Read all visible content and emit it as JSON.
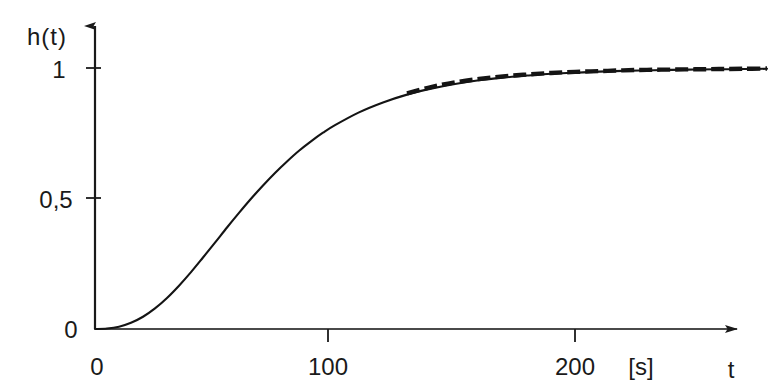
{
  "chart_data": {
    "type": "line",
    "title": "",
    "subtitle": "",
    "xlabel": "t",
    "xunit": "[s]",
    "ylabel": "h(t)",
    "xlim": [
      0,
      280
    ],
    "ylim": [
      0,
      1.08
    ],
    "grid": false,
    "legend": "none",
    "x_ticks": [
      {
        "value": 0,
        "label": "0"
      },
      {
        "value": 100,
        "label": "100"
      },
      {
        "value": 200,
        "label": "200"
      }
    ],
    "y_ticks": [
      {
        "value": 0,
        "label": "0"
      },
      {
        "value": 0.5,
        "label": "0,5"
      },
      {
        "value": 1,
        "label": "1"
      }
    ],
    "x": [
      0,
      5,
      10,
      15,
      20,
      25,
      30,
      35,
      40,
      45,
      50,
      55,
      60,
      65,
      70,
      75,
      80,
      85,
      90,
      95,
      100,
      110,
      120,
      130,
      140,
      150,
      160,
      170,
      180,
      190,
      200,
      210,
      220,
      230,
      240,
      250,
      260,
      270,
      280
    ],
    "series": [
      {
        "name": "h(t)",
        "style": "solid",
        "color": "#141414",
        "values": [
          0.0,
          0.002,
          0.009,
          0.024,
          0.047,
          0.079,
          0.119,
          0.166,
          0.218,
          0.274,
          0.331,
          0.389,
          0.445,
          0.499,
          0.55,
          0.598,
          0.642,
          0.683,
          0.719,
          0.752,
          0.781,
          0.83,
          0.868,
          0.898,
          0.921,
          0.939,
          0.953,
          0.963,
          0.971,
          0.978,
          0.982,
          0.986,
          0.989,
          0.991,
          0.993,
          0.994,
          0.995,
          0.996,
          0.997
        ]
      },
      {
        "name": "approximation",
        "style": "dashed",
        "color": "#141414",
        "x_start": 125,
        "values": [
          null,
          null,
          null,
          null,
          null,
          null,
          null,
          null,
          null,
          null,
          null,
          null,
          null,
          null,
          null,
          null,
          null,
          null,
          null,
          null,
          null,
          null,
          null,
          0.903,
          0.927,
          0.945,
          0.958,
          0.968,
          0.975,
          0.981,
          0.985,
          0.988,
          0.991,
          0.993,
          0.994,
          0.995,
          0.996,
          0.997,
          0.998
        ]
      }
    ]
  },
  "axes": {
    "y_axis_label": "h(t)",
    "x_axis_label": "t",
    "x_axis_unit": "[s]",
    "y_tick_1": "1",
    "y_tick_half": "0,5",
    "y_tick_zero": "0",
    "x_tick_zero": "0",
    "x_tick_100": "100",
    "x_tick_200": "200"
  }
}
